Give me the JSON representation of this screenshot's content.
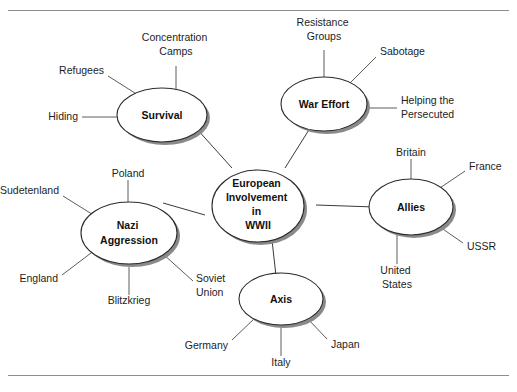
{
  "figure": {
    "caption_top": "",
    "center": {
      "label_lines": [
        "European",
        "Involvement",
        "in",
        "WWII"
      ],
      "name": "European Involvement in WWII"
    },
    "branches": [
      {
        "id": "survival",
        "label_lines": [
          "Survival"
        ],
        "leaves": [
          {
            "id": "concentration-camps",
            "lines": [
              "Concentration",
              "Camps"
            ]
          },
          {
            "id": "refugees",
            "lines": [
              "Refugees"
            ]
          },
          {
            "id": "hiding",
            "lines": [
              "Hiding"
            ]
          }
        ]
      },
      {
        "id": "war-effort",
        "label_lines": [
          "War Effort"
        ],
        "leaves": [
          {
            "id": "resistance-groups",
            "lines": [
              "Resistance",
              "Groups"
            ]
          },
          {
            "id": "sabotage",
            "lines": [
              "Sabotage"
            ]
          },
          {
            "id": "helping-the-persecuted",
            "lines": [
              "Helping the",
              "Persecuted"
            ]
          }
        ]
      },
      {
        "id": "allies",
        "label_lines": [
          "Allies"
        ],
        "leaves": [
          {
            "id": "britain",
            "lines": [
              "Britain"
            ]
          },
          {
            "id": "france",
            "lines": [
              "France"
            ]
          },
          {
            "id": "ussr",
            "lines": [
              "USSR"
            ]
          },
          {
            "id": "united-states",
            "lines": [
              "United",
              "States"
            ]
          }
        ]
      },
      {
        "id": "axis",
        "label_lines": [
          "Axis"
        ],
        "leaves": [
          {
            "id": "germany",
            "lines": [
              "Germany"
            ]
          },
          {
            "id": "italy",
            "lines": [
              "Italy"
            ]
          },
          {
            "id": "japan",
            "lines": [
              "Japan"
            ]
          }
        ]
      },
      {
        "id": "nazi-aggression",
        "label_lines": [
          "Nazi",
          "Aggression"
        ],
        "leaves": [
          {
            "id": "poland",
            "lines": [
              "Poland"
            ]
          },
          {
            "id": "sudetenland",
            "lines": [
              "Sudetenland"
            ]
          },
          {
            "id": "england",
            "lines": [
              "England"
            ]
          },
          {
            "id": "blitzkrieg",
            "lines": [
              "Blitzkrieg"
            ]
          },
          {
            "id": "soviet-union",
            "lines": [
              "Soviet",
              "Union"
            ]
          }
        ]
      }
    ],
    "colors": {
      "ellipse_stroke": "#2b2b2b",
      "ellipse_fill": "#ffffff",
      "shadow": "#8a8a8a",
      "line": "#3a3a3a",
      "rule": "#8d8d8d",
      "text": "#1a1a1a"
    }
  }
}
